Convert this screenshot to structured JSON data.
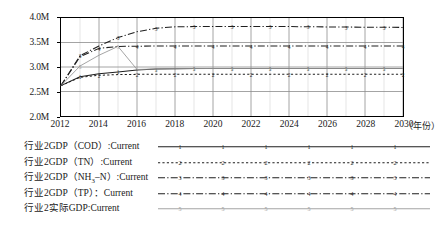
{
  "chart_data": {
    "type": "line",
    "title": "",
    "xlabel": "年份",
    "ylabel": "",
    "xlim": [
      2012,
      2030
    ],
    "ylim": [
      2000000,
      4000000
    ],
    "grid": true,
    "legend_position": "below",
    "x": [
      2012,
      2013,
      2014,
      2015,
      2016,
      2017,
      2018,
      2019,
      2020,
      2021,
      2022,
      2023,
      2024,
      2025,
      2026,
      2027,
      2028,
      2029,
      2030
    ],
    "y_tick_labels": [
      "2.0M",
      "2.5M",
      "3.0M",
      "3.5M",
      "4.0M"
    ],
    "y_tick_values": [
      2000000,
      2500000,
      3000000,
      3500000,
      4000000
    ],
    "x_tick_labels": [
      "2012",
      "2014",
      "2016",
      "2018",
      "2020",
      "2022",
      "2024",
      "2026",
      "2028",
      "2030"
    ],
    "x_tick_values": [
      2012,
      2014,
      2016,
      2018,
      2020,
      2022,
      2024,
      2026,
      2028,
      2030
    ],
    "series": [
      {
        "name": "行业2GDP（COD）:Current",
        "marker": "1",
        "color": "#1f1f1f",
        "style": "solid",
        "values": [
          2620000,
          2800000,
          2860000,
          2900000,
          2940000,
          2960000,
          2965000,
          2968000,
          2970000,
          2970000,
          2970000,
          2970000,
          2970000,
          2970000,
          2970000,
          2970000,
          2970000,
          2970000,
          2970000
        ]
      },
      {
        "name": "行业2GDP（TN）:Current",
        "marker": "2",
        "color": "#1f1f1f",
        "style": "dotted",
        "values": [
          2620000,
          2790000,
          2830000,
          2845000,
          2850000,
          2852000,
          2853000,
          2853000,
          2853000,
          2853000,
          2853000,
          2853000,
          2853000,
          2853000,
          2853000,
          2853000,
          2853000,
          2853000,
          2853000
        ]
      },
      {
        "name": "行业2GDP（NH₃–N）:Current",
        "marker": "3",
        "color": "#1f1f1f",
        "style": "dashdot",
        "values": [
          2620000,
          3230000,
          3430000,
          3600000,
          3720000,
          3790000,
          3820000,
          3825000,
          3828000,
          3828000,
          3828000,
          3828000,
          3825000,
          3822000,
          3818000,
          3815000,
          3812000,
          3810000,
          3808000
        ]
      },
      {
        "name": "行业2GDP（TP）：Current",
        "marker": "4",
        "color": "#1f1f1f",
        "style": "dashdot",
        "values": [
          2620000,
          3210000,
          3380000,
          3420000,
          3425000,
          3427000,
          3428000,
          3428000,
          3428000,
          3428000,
          3428000,
          3428000,
          3428000,
          3428000,
          3428000,
          3428000,
          3428000,
          3428000,
          3428000
        ]
      },
      {
        "name": "行业2实际GDP:Current",
        "marker": "5",
        "color": "#9a9a9a",
        "style": "solid",
        "values": [
          2620000,
          3020000,
          3240000,
          3420000,
          2950000,
          2960000,
          2965000,
          2968000,
          2970000,
          2970000,
          2970000,
          2970000,
          2970000,
          2970000,
          2970000,
          2970000,
          2970000,
          2970000,
          2970000
        ]
      }
    ]
  },
  "legend": {
    "items": [
      {
        "label": "行业2GDP（COD）:Current",
        "marker": "1",
        "style": "solid",
        "color": "#1f1f1f"
      },
      {
        "label": "行业2GDP（TN）:Current",
        "marker": "2",
        "style": "dotted",
        "color": "#1f1f1f"
      },
      {
        "label": "行业2GDP（NH₃–N）:Current",
        "marker": "3",
        "style": "dashdot",
        "color": "#1f1f1f"
      },
      {
        "label": "行业2GDP（TP）：Current",
        "marker": "4",
        "style": "dashdot",
        "color": "#1f1f1f"
      },
      {
        "label": "行业2实际GDP:Current",
        "marker": "5",
        "style": "solid",
        "color": "#9a9a9a"
      }
    ]
  },
  "axis": {
    "x_unit_label": "（年份）"
  }
}
